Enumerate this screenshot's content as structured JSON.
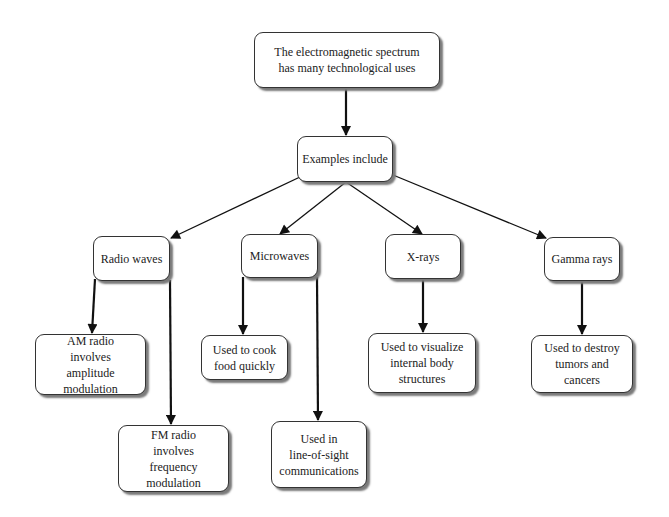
{
  "diagram": {
    "type": "tree",
    "root": {
      "id": "root",
      "label": "The electromagnetic spectrum\nhas many technological uses"
    },
    "nodes": [
      {
        "id": "examples",
        "label": "Examples include"
      },
      {
        "id": "radio",
        "label": "Radio waves"
      },
      {
        "id": "micro",
        "label": "Microwaves"
      },
      {
        "id": "xray",
        "label": "X-rays"
      },
      {
        "id": "gamma",
        "label": "Gamma rays"
      },
      {
        "id": "am",
        "label": "AM radio\ninvolves\namplitude modulation"
      },
      {
        "id": "cook",
        "label": "Used to cook\nfood quickly"
      },
      {
        "id": "visualize",
        "label": "Used to visualize\ninternal body\nstructures"
      },
      {
        "id": "destroy",
        "label": "Used to destroy\ntumors and cancers"
      },
      {
        "id": "fm",
        "label": "FM radio\ninvolves\nfrequency modulation"
      },
      {
        "id": "los",
        "label": "Used in\nline-of-sight\ncommunications"
      }
    ],
    "edges": [
      {
        "from": "root",
        "to": "examples"
      },
      {
        "from": "examples",
        "to": "radio"
      },
      {
        "from": "examples",
        "to": "micro"
      },
      {
        "from": "examples",
        "to": "xray"
      },
      {
        "from": "examples",
        "to": "gamma"
      },
      {
        "from": "radio",
        "to": "am"
      },
      {
        "from": "radio",
        "to": "fm"
      },
      {
        "from": "micro",
        "to": "cook"
      },
      {
        "from": "micro",
        "to": "los"
      },
      {
        "from": "xray",
        "to": "visualize"
      },
      {
        "from": "gamma",
        "to": "destroy"
      }
    ]
  }
}
